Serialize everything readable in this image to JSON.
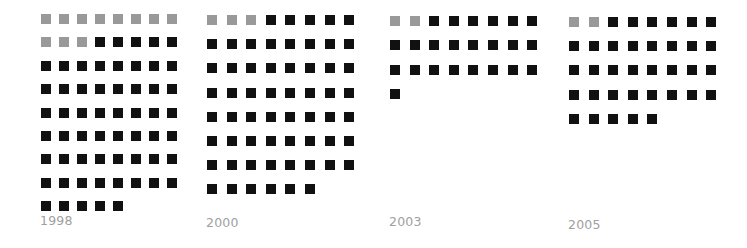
{
  "chart_data": {
    "type": "waffle",
    "title": "",
    "columns_per_row": 8,
    "legend": [],
    "colors": {
      "gray": "#999999",
      "black": "#111111"
    },
    "groups": [
      {
        "label": "1998",
        "gray": 11,
        "black": 58,
        "total": 69
      },
      {
        "label": "2000",
        "gray": 3,
        "black": 59,
        "total": 62
      },
      {
        "label": "2003",
        "gray": 2,
        "black": 23,
        "total": 25
      },
      {
        "label": "2005",
        "gray": 2,
        "black": 35,
        "total": 37
      }
    ]
  },
  "labels": {
    "g0": "1998",
    "g1": "2000",
    "g2": "2003",
    "g3": "2005"
  }
}
